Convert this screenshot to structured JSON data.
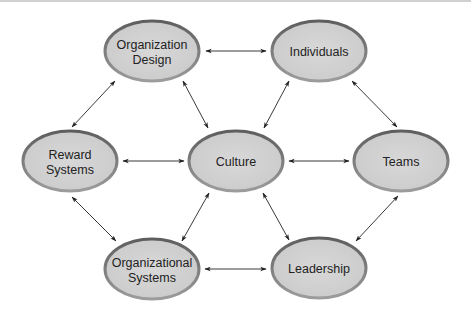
{
  "diagram": {
    "type": "bidirectional-network",
    "colors": {
      "node_fill": "#d3d3d3",
      "node_border": "#6e6e6e",
      "node_border_light": "#9a9a9a",
      "text": "#222222",
      "arrow": "#222222"
    },
    "nodes": [
      {
        "id": "org_design",
        "lines": [
          "Organization",
          "Design"
        ],
        "cx": 152,
        "cy": 51
      },
      {
        "id": "individuals",
        "lines": [
          "Individuals"
        ],
        "cx": 319,
        "cy": 51
      },
      {
        "id": "reward_systems",
        "lines": [
          "Reward",
          "Systems"
        ],
        "cx": 70,
        "cy": 161
      },
      {
        "id": "culture",
        "lines": [
          "Culture"
        ],
        "cx": 236,
        "cy": 161
      },
      {
        "id": "teams",
        "lines": [
          "Teams"
        ],
        "cx": 401,
        "cy": 161
      },
      {
        "id": "org_systems",
        "lines": [
          "Organizational",
          "Systems"
        ],
        "cx": 152,
        "cy": 269
      },
      {
        "id": "leadership",
        "lines": [
          "Leadership"
        ],
        "cx": 319,
        "cy": 268
      }
    ],
    "edges": [
      {
        "from": "org_design",
        "to": "individuals",
        "direction": "both"
      },
      {
        "from": "org_design",
        "to": "reward_systems",
        "direction": "both"
      },
      {
        "from": "org_design",
        "to": "culture",
        "direction": "both"
      },
      {
        "from": "individuals",
        "to": "culture",
        "direction": "both"
      },
      {
        "from": "individuals",
        "to": "teams",
        "direction": "both"
      },
      {
        "from": "reward_systems",
        "to": "culture",
        "direction": "both"
      },
      {
        "from": "culture",
        "to": "teams",
        "direction": "both"
      },
      {
        "from": "reward_systems",
        "to": "org_systems",
        "direction": "both"
      },
      {
        "from": "culture",
        "to": "org_systems",
        "direction": "both"
      },
      {
        "from": "culture",
        "to": "leadership",
        "direction": "both"
      },
      {
        "from": "teams",
        "to": "leadership",
        "direction": "both"
      },
      {
        "from": "org_systems",
        "to": "leadership",
        "direction": "both"
      }
    ]
  },
  "labels": {
    "org_design_1": "Organization",
    "org_design_2": "Design",
    "individuals": "Individuals",
    "reward_systems_1": "Reward",
    "reward_systems_2": "Systems",
    "culture": "Culture",
    "teams": "Teams",
    "org_systems_1": "Organizational",
    "org_systems_2": "Systems",
    "leadership": "Leadership"
  }
}
